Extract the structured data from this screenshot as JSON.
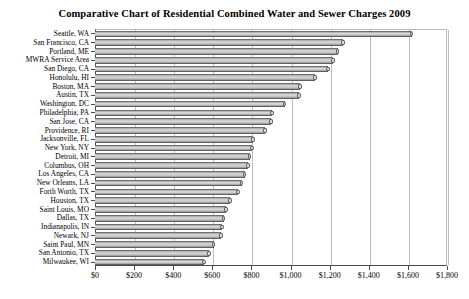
{
  "chart_data": {
    "type": "bar",
    "orientation": "horizontal",
    "title": "Comparative Chart of Residential Combined Water and Sewer Charges 2009",
    "xlabel": "",
    "ylabel": "",
    "xlim": [
      0,
      1800
    ],
    "xticks": [
      0,
      200,
      400,
      600,
      800,
      1000,
      1200,
      1400,
      1600,
      1800
    ],
    "xtick_labels": [
      "$0",
      "$200",
      "$400",
      "$600",
      "$800",
      "$1,000",
      "$1,200",
      "$1,400",
      "$1,600",
      "$1,800"
    ],
    "grid": true,
    "grid_axis": "x",
    "legend": false,
    "bar_style": "3d-cylinder",
    "bar_color": "#cfcfcf",
    "bar_edge_color": "#5f5f5f",
    "categories": [
      "Seattle, WA",
      "San Francisco, CA",
      "Portland, ME",
      "MWRA Service Area",
      "San Diego, CA",
      "Honolulu, HI",
      "Boston, MA",
      "Austin, TX",
      "Washington, DC",
      "Philadelphia, PA",
      "San Jose, CA",
      "Providence, RI",
      "Jacksonville, FL",
      "New York, NY",
      "Detroit, MI",
      "Columbus, OH",
      "Los Angeles, CA",
      "New Orleans, LA",
      "Forth Worth, TX",
      "Houston, TX",
      "Saint Louis, MO",
      "Dallas, TX",
      "Indianapolis, IN",
      "Newark, NJ",
      "Saint Paul, MN",
      "San Antonio, TX",
      "Milwaukee, WI"
    ],
    "values": [
      1620,
      1268,
      1242,
      1217,
      1191,
      1125,
      1048,
      1043,
      971,
      905,
      900,
      869,
      808,
      803,
      792,
      782,
      766,
      751,
      731,
      690,
      670,
      659,
      649,
      644,
      608,
      583,
      557
    ]
  }
}
